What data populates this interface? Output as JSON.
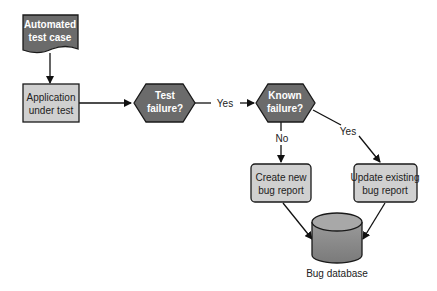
{
  "diagram": {
    "nodes": {
      "test_case": {
        "line1": "Automated",
        "line2": "test case",
        "shape": "document"
      },
      "app": {
        "line1": "Application",
        "line2": "under test",
        "shape": "process"
      },
      "test_failure": {
        "line1": "Test",
        "line2": "failure?",
        "shape": "decision"
      },
      "known_failure": {
        "line1": "Known",
        "line2": "failure?",
        "shape": "decision"
      },
      "create_bug": {
        "line1": "Create new",
        "line2": "bug report",
        "shape": "process"
      },
      "update_bug": {
        "line1": "Update existing",
        "line2": "bug report",
        "shape": "process"
      },
      "bug_db": {
        "label": "Bug database",
        "shape": "database"
      }
    },
    "edges": {
      "yes1": "Yes",
      "no": "No",
      "yes2": "Yes"
    },
    "colors": {
      "dark_fill": "#6b6b6b",
      "light_fill": "#d0d0d0",
      "stroke": "#1a1a1a"
    }
  }
}
